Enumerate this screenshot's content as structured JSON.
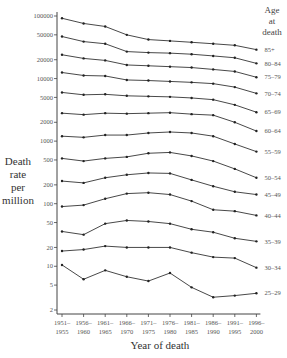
{
  "chart_data": {
    "type": "line",
    "title": "",
    "xlabel": "Year of death",
    "ylabel": "Death rate per million",
    "ylabel_lines": [
      "Death",
      "rate",
      "per",
      "million"
    ],
    "yscale": "log",
    "ylim": [
      2,
      100000
    ],
    "yticks": [
      100000,
      50000,
      20000,
      10000,
      5000,
      2000,
      1000,
      500,
      200,
      100,
      50,
      20,
      10,
      5,
      2
    ],
    "ytick_labels": [
      "100000",
      "50000",
      "20000",
      "10000",
      "5000",
      "2000",
      "1000",
      "500",
      "200",
      "100",
      "50",
      "20",
      "10",
      "5",
      "2"
    ],
    "categories": [
      [
        "1951–",
        "1955"
      ],
      [
        "1956–",
        "1960"
      ],
      [
        "1961–",
        "1965"
      ],
      [
        "1966–",
        "1970"
      ],
      [
        "1971–",
        "1975"
      ],
      [
        "1976–",
        "1980"
      ],
      [
        "1981–",
        "1985"
      ],
      [
        "1986–",
        "1990"
      ],
      [
        "1991–",
        "1995"
      ],
      [
        "1996–",
        "2000"
      ]
    ],
    "legend_title": [
      "Age",
      "at",
      "death"
    ],
    "legend_position": "right (inline labels at line ends)",
    "grid": false,
    "series": [
      {
        "name": "85+",
        "values": [
          92000,
          76000,
          68000,
          50000,
          42000,
          40000,
          38000,
          36000,
          34000,
          29000
        ]
      },
      {
        "name": "80–84",
        "values": [
          47000,
          39000,
          36000,
          27000,
          26000,
          25500,
          24500,
          23000,
          21500,
          17500
        ]
      },
      {
        "name": "75–79",
        "values": [
          24000,
          21000,
          19500,
          16500,
          16000,
          15500,
          15000,
          14000,
          13000,
          10500
        ]
      },
      {
        "name": "70–74",
        "values": [
          12500,
          11200,
          11000,
          9500,
          9300,
          9000,
          8700,
          8300,
          7300,
          5800
        ]
      },
      {
        "name": "65–69",
        "values": [
          6000,
          5500,
          5600,
          5300,
          5200,
          5100,
          4900,
          4600,
          3800,
          2900
        ]
      },
      {
        "name": "60–64",
        "values": [
          2800,
          2650,
          2800,
          2750,
          2800,
          2850,
          2700,
          2600,
          2000,
          1450
        ]
      },
      {
        "name": "55–59",
        "values": [
          1200,
          1150,
          1250,
          1250,
          1350,
          1400,
          1350,
          1200,
          900,
          680
        ]
      },
      {
        "name": "50–54",
        "values": [
          530,
          480,
          530,
          560,
          640,
          660,
          580,
          480,
          360,
          260
        ]
      },
      {
        "name": "45–49",
        "values": [
          230,
          215,
          260,
          290,
          310,
          305,
          240,
          190,
          155,
          140
        ]
      },
      {
        "name": "40–44",
        "values": [
          90,
          95,
          120,
          145,
          150,
          140,
          110,
          80,
          76,
          65
        ]
      },
      {
        "name": "35–39",
        "values": [
          36,
          32,
          48,
          54,
          52,
          48,
          39,
          35,
          28,
          25
        ]
      },
      {
        "name": "30–34",
        "values": [
          17.5,
          18.5,
          21,
          20,
          20,
          20,
          16.5,
          14,
          13.5,
          9.5
        ]
      },
      {
        "name": "25–29",
        "values": [
          10.5,
          6.2,
          8.6,
          6.8,
          5.8,
          7.8,
          4.6,
          3.2,
          3.4,
          3.7
        ]
      }
    ]
  }
}
